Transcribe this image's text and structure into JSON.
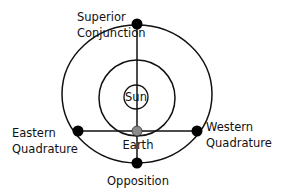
{
  "diagram": {
    "type": "planetary-configurations",
    "labels": {
      "superior_line1": "Superior",
      "superior_line2": "Conjunction",
      "sun": "Sun",
      "earth": "Earth",
      "eastern_line1": "Eastern",
      "eastern_line2": "Quadrature",
      "western_line1": "Western",
      "western_line2": "Quadrature",
      "opposition": "Opposition"
    },
    "colors": {
      "line": "#111111",
      "planet_dot": "#000000",
      "earth_dot": "#8a8a8a",
      "background": "#ffffff"
    }
  }
}
